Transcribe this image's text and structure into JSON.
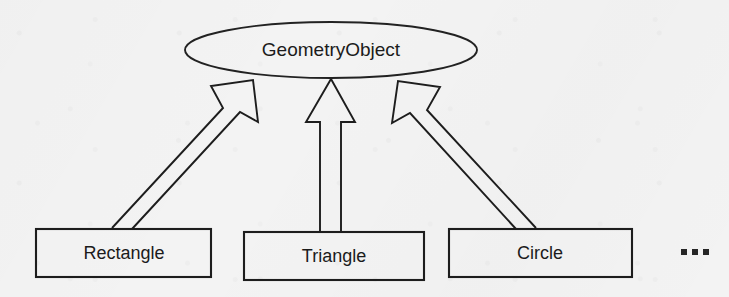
{
  "diagram": {
    "kind": "uml-class-inheritance",
    "title_visible": false,
    "background_color": "#f3f3f3",
    "stroke_color": "#1d1d1d",
    "text_color": "#1b1b1b",
    "root": {
      "label": "GeometryObject",
      "shape": "ellipse"
    },
    "children": [
      {
        "label": "Rectangle",
        "shape": "rectangle"
      },
      {
        "label": "Triangle",
        "shape": "rectangle"
      },
      {
        "label": "Circle",
        "shape": "rectangle"
      }
    ],
    "continuation": {
      "label": "...",
      "meaning": "more-subclasses-omitted"
    },
    "relationships": [
      {
        "from": "Rectangle",
        "to": "GeometryObject",
        "type": "generalization",
        "arrowhead": "hollow-triangle"
      },
      {
        "from": "Triangle",
        "to": "GeometryObject",
        "type": "generalization",
        "arrowhead": "hollow-triangle"
      },
      {
        "from": "Circle",
        "to": "GeometryObject",
        "type": "generalization",
        "arrowhead": "hollow-triangle"
      }
    ]
  }
}
